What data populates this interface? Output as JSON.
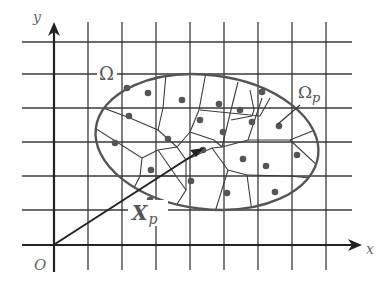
{
  "figure": {
    "labels": {
      "y_axis": "y",
      "x_axis": "x",
      "origin": "O",
      "domain": "Ω",
      "cell": "Ω",
      "cell_subscript": "p",
      "position_vector": "X",
      "position_subscript": "p"
    },
    "grid": {
      "columns": 8,
      "rows": 6
    },
    "material_point_count": 22,
    "colors": {
      "lines": "#3a3a3a",
      "boundary": "#555555",
      "points": "#555555",
      "labels": "#666666"
    }
  }
}
